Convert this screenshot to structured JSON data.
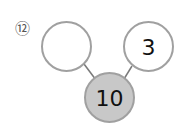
{
  "problem": {
    "number_label": "⑫"
  },
  "diagram": {
    "type": "number-bond",
    "whole": {
      "value": "10",
      "fill": "#c8c8c8"
    },
    "parts": [
      {
        "value": "",
        "fill": "#ffffff"
      },
      {
        "value": "3",
        "fill": "#ffffff"
      }
    ],
    "stroke_color": "#a0a0a0"
  }
}
